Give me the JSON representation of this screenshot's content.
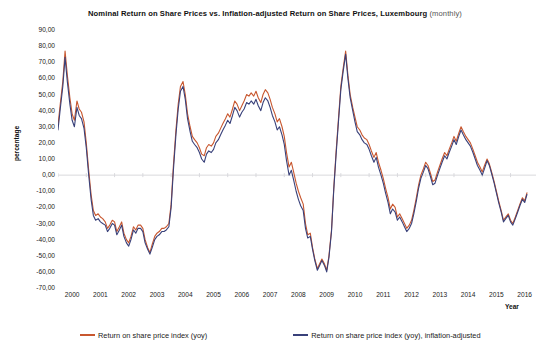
{
  "chart_data": {
    "type": "line",
    "title": "Nominal Return on Share Prices vs. Inflation-adjusted Return on Share Prices, Luxembourg",
    "title_suffix": "(monthly)",
    "xlabel": "Year",
    "ylabel": "percentage",
    "ylim": [
      -70,
      90
    ],
    "yticks": [
      "90,00",
      "80,00",
      "70,00",
      "60,00",
      "50,00",
      "40,00",
      "30,00",
      "20,00",
      "10,00",
      "0,00",
      "-10,00",
      "-20,00",
      "-30,00",
      "-40,00",
      "-50,00",
      "-60,00",
      "-70,00"
    ],
    "ytick_values": [
      90,
      80,
      70,
      60,
      50,
      40,
      30,
      20,
      10,
      0,
      -10,
      -20,
      -30,
      -40,
      -50,
      -60,
      -70
    ],
    "xticks": [
      "2000",
      "2001",
      "2002",
      "2003",
      "2004",
      "2005",
      "2006",
      "2007",
      "2008",
      "2009",
      "2010",
      "2011",
      "2012",
      "2013",
      "2014",
      "2015",
      "2016"
    ],
    "xlim": [
      2000,
      2016.9
    ],
    "grid": "zero-line-only",
    "legend_position": "bottom",
    "colors": {
      "nominal": "#C8572F",
      "inflation_adjusted": "#39417A",
      "gridline": "#D9D9DD",
      "background": "#FFFFFF"
    },
    "series": [
      {
        "name": "Return on share price index (yoy)",
        "key": "nominal",
        "color": "#C8572F",
        "x": [
          2000.0,
          2000.08,
          2000.17,
          2000.25,
          2000.33,
          2000.42,
          2000.5,
          2000.58,
          2000.67,
          2000.75,
          2000.83,
          2000.92,
          2001.0,
          2001.08,
          2001.17,
          2001.25,
          2001.33,
          2001.42,
          2001.5,
          2001.58,
          2001.67,
          2001.75,
          2001.83,
          2001.92,
          2002.0,
          2002.08,
          2002.17,
          2002.25,
          2002.33,
          2002.42,
          2002.5,
          2002.58,
          2002.67,
          2002.75,
          2002.83,
          2002.92,
          2003.0,
          2003.08,
          2003.17,
          2003.25,
          2003.33,
          2003.42,
          2003.5,
          2003.58,
          2003.67,
          2003.75,
          2003.83,
          2003.92,
          2004.0,
          2004.08,
          2004.17,
          2004.25,
          2004.33,
          2004.42,
          2004.5,
          2004.58,
          2004.67,
          2004.75,
          2004.83,
          2004.92,
          2005.0,
          2005.08,
          2005.17,
          2005.25,
          2005.33,
          2005.42,
          2005.5,
          2005.58,
          2005.67,
          2005.75,
          2005.83,
          2005.92,
          2006.0,
          2006.08,
          2006.17,
          2006.25,
          2006.33,
          2006.42,
          2006.5,
          2006.58,
          2006.67,
          2006.75,
          2006.83,
          2006.92,
          2007.0,
          2007.08,
          2007.17,
          2007.25,
          2007.33,
          2007.42,
          2007.5,
          2007.58,
          2007.67,
          2007.75,
          2007.83,
          2007.92,
          2008.0,
          2008.08,
          2008.17,
          2008.25,
          2008.33,
          2008.42,
          2008.5,
          2008.58,
          2008.67,
          2008.75,
          2008.83,
          2008.92,
          2009.0,
          2009.08,
          2009.17,
          2009.25,
          2009.33,
          2009.42,
          2009.5,
          2009.58,
          2009.67,
          2009.75,
          2009.83,
          2009.92,
          2010.0,
          2010.08,
          2010.17,
          2010.25,
          2010.33,
          2010.42,
          2010.5,
          2010.58,
          2010.67,
          2010.75,
          2010.83,
          2010.92,
          2011.0,
          2011.08,
          2011.17,
          2011.25,
          2011.33,
          2011.42,
          2011.5,
          2011.58,
          2011.67,
          2011.75,
          2011.83,
          2011.92,
          2012.0,
          2012.08,
          2012.17,
          2012.25,
          2012.33,
          2012.42,
          2012.5,
          2012.58,
          2012.67,
          2012.75,
          2012.83,
          2012.92,
          2013.0,
          2013.08,
          2013.17,
          2013.25,
          2013.33,
          2013.42,
          2013.5,
          2013.58,
          2013.67,
          2013.75,
          2013.83,
          2013.92,
          2014.0,
          2014.08,
          2014.17,
          2014.25,
          2014.33,
          2014.42,
          2014.5,
          2014.58,
          2014.67,
          2014.75,
          2014.83,
          2014.92,
          2015.0,
          2015.08,
          2015.17,
          2015.25,
          2015.33,
          2015.42,
          2015.5,
          2015.58,
          2015.67,
          2015.75,
          2015.83,
          2015.92,
          2016.0,
          2016.08,
          2016.17,
          2016.25,
          2016.33,
          2016.42,
          2016.5,
          2016.58
        ],
        "values": [
          31,
          44,
          58,
          77,
          62,
          48,
          38,
          34,
          46,
          41,
          39,
          33,
          20,
          4,
          -12,
          -22,
          -25,
          -24,
          -26,
          -27,
          -29,
          -33,
          -31,
          -28,
          -29,
          -35,
          -32,
          -29,
          -36,
          -40,
          -42,
          -38,
          -32,
          -34,
          -31,
          -31,
          -33,
          -40,
          -45,
          -48,
          -43,
          -38,
          -36,
          -35,
          -33,
          -33,
          -32,
          -30,
          -18,
          6,
          28,
          44,
          55,
          58,
          50,
          38,
          30,
          24,
          22,
          20,
          17,
          13,
          12,
          17,
          19,
          18,
          20,
          24,
          26,
          29,
          32,
          35,
          38,
          36,
          41,
          46,
          44,
          40,
          43,
          46,
          50,
          49,
          51,
          49,
          52,
          48,
          45,
          50,
          53,
          51,
          47,
          42,
          38,
          33,
          35,
          30,
          24,
          14,
          5,
          8,
          2,
          -5,
          -10,
          -14,
          -18,
          -30,
          -37,
          -36,
          -45,
          -52,
          -58,
          -55,
          -52,
          -55,
          -59,
          -50,
          -34,
          -8,
          14,
          36,
          55,
          66,
          77,
          62,
          50,
          42,
          36,
          30,
          28,
          25,
          23,
          22,
          19,
          15,
          11,
          14,
          8,
          3,
          -2,
          -8,
          -14,
          -21,
          -18,
          -20,
          -26,
          -24,
          -27,
          -30,
          -33,
          -31,
          -28,
          -22,
          -14,
          -6,
          0,
          4,
          8,
          6,
          1,
          -4,
          -3,
          2,
          6,
          10,
          14,
          12,
          16,
          20,
          24,
          21,
          26,
          30,
          27,
          24,
          22,
          20,
          16,
          12,
          8,
          5,
          2,
          6,
          10,
          7,
          2,
          -4,
          -10,
          -16,
          -22,
          -28,
          -26,
          -24,
          -28,
          -30,
          -26,
          -22,
          -18,
          -14,
          -16,
          -11
        ]
      },
      {
        "name": "Return on share price index (yoy), inflation-adjusted",
        "key": "inflation_adjusted",
        "color": "#39417A",
        "x": [
          2000.0,
          2000.08,
          2000.17,
          2000.25,
          2000.33,
          2000.42,
          2000.5,
          2000.58,
          2000.67,
          2000.75,
          2000.83,
          2000.92,
          2001.0,
          2001.08,
          2001.17,
          2001.25,
          2001.33,
          2001.42,
          2001.5,
          2001.58,
          2001.67,
          2001.75,
          2001.83,
          2001.92,
          2002.0,
          2002.08,
          2002.17,
          2002.25,
          2002.33,
          2002.42,
          2002.5,
          2002.58,
          2002.67,
          2002.75,
          2002.83,
          2002.92,
          2003.0,
          2003.08,
          2003.17,
          2003.25,
          2003.33,
          2003.42,
          2003.5,
          2003.58,
          2003.67,
          2003.75,
          2003.83,
          2003.92,
          2004.0,
          2004.08,
          2004.17,
          2004.25,
          2004.33,
          2004.42,
          2004.5,
          2004.58,
          2004.67,
          2004.75,
          2004.83,
          2004.92,
          2005.0,
          2005.08,
          2005.17,
          2005.25,
          2005.33,
          2005.42,
          2005.5,
          2005.58,
          2005.67,
          2005.75,
          2005.83,
          2005.92,
          2006.0,
          2006.08,
          2006.17,
          2006.25,
          2006.33,
          2006.42,
          2006.5,
          2006.58,
          2006.67,
          2006.75,
          2006.83,
          2006.92,
          2007.0,
          2007.08,
          2007.17,
          2007.25,
          2007.33,
          2007.42,
          2007.5,
          2007.58,
          2007.67,
          2007.75,
          2007.83,
          2007.92,
          2008.0,
          2008.08,
          2008.17,
          2008.25,
          2008.33,
          2008.42,
          2008.5,
          2008.58,
          2008.67,
          2008.75,
          2008.83,
          2008.92,
          2009.0,
          2009.08,
          2009.17,
          2009.25,
          2009.33,
          2009.42,
          2009.5,
          2009.58,
          2009.67,
          2009.75,
          2009.83,
          2009.92,
          2010.0,
          2010.08,
          2010.17,
          2010.25,
          2010.33,
          2010.42,
          2010.5,
          2010.58,
          2010.67,
          2010.75,
          2010.83,
          2010.92,
          2011.0,
          2011.08,
          2011.17,
          2011.25,
          2011.33,
          2011.42,
          2011.5,
          2011.58,
          2011.67,
          2011.75,
          2011.83,
          2011.92,
          2012.0,
          2012.08,
          2012.17,
          2012.25,
          2012.33,
          2012.42,
          2012.5,
          2012.58,
          2012.67,
          2012.75,
          2012.83,
          2012.92,
          2013.0,
          2013.08,
          2013.17,
          2013.25,
          2013.33,
          2013.42,
          2013.5,
          2013.58,
          2013.67,
          2013.75,
          2013.83,
          2013.92,
          2014.0,
          2014.08,
          2014.17,
          2014.25,
          2014.33,
          2014.42,
          2014.5,
          2014.58,
          2014.67,
          2014.75,
          2014.83,
          2014.92,
          2015.0,
          2015.08,
          2015.17,
          2015.25,
          2015.33,
          2015.42,
          2015.5,
          2015.58,
          2015.67,
          2015.75,
          2015.83,
          2015.92,
          2016.0,
          2016.08,
          2016.17,
          2016.25,
          2016.33,
          2016.42,
          2016.5,
          2016.58
        ],
        "values": [
          28,
          41,
          55,
          73,
          58,
          44,
          34,
          30,
          42,
          37,
          35,
          29,
          17,
          1,
          -15,
          -25,
          -28,
          -27,
          -29,
          -30,
          -31,
          -35,
          -33,
          -30,
          -31,
          -37,
          -34,
          -31,
          -38,
          -42,
          -44,
          -40,
          -34,
          -36,
          -33,
          -33,
          -35,
          -42,
          -46,
          -49,
          -45,
          -40,
          -38,
          -37,
          -35,
          -35,
          -34,
          -32,
          -20,
          3,
          25,
          41,
          52,
          55,
          47,
          35,
          27,
          21,
          19,
          17,
          14,
          10,
          8,
          13,
          15,
          14,
          16,
          20,
          22,
          25,
          28,
          31,
          34,
          32,
          37,
          42,
          40,
          36,
          39,
          41,
          45,
          44,
          46,
          44,
          47,
          43,
          40,
          45,
          48,
          46,
          42,
          37,
          33,
          28,
          30,
          25,
          19,
          9,
          0,
          3,
          -3,
          -10,
          -15,
          -19,
          -22,
          -33,
          -39,
          -38,
          -46,
          -53,
          -59,
          -56,
          -53,
          -56,
          -60,
          -51,
          -35,
          -9,
          12,
          34,
          53,
          64,
          75,
          60,
          48,
          40,
          33,
          27,
          25,
          22,
          20,
          19,
          16,
          12,
          8,
          11,
          5,
          0,
          -5,
          -11,
          -17,
          -24,
          -21,
          -23,
          -28,
          -26,
          -29,
          -32,
          -35,
          -33,
          -30,
          -24,
          -16,
          -8,
          -2,
          2,
          6,
          4,
          -1,
          -6,
          -5,
          0,
          4,
          8,
          12,
          10,
          14,
          18,
          22,
          19,
          24,
          28,
          25,
          22,
          20,
          18,
          14,
          10,
          6,
          3,
          0,
          4,
          9,
          6,
          1,
          -5,
          -11,
          -17,
          -23,
          -29,
          -27,
          -25,
          -29,
          -31,
          -27,
          -23,
          -19,
          -15,
          -17,
          -12
        ]
      }
    ]
  },
  "legend": [
    {
      "label": "Return on share price index (yoy)",
      "color": "#C8572F"
    },
    {
      "label": "Return on share price index (yoy), inflation-adjusted",
      "color": "#39417A"
    }
  ]
}
